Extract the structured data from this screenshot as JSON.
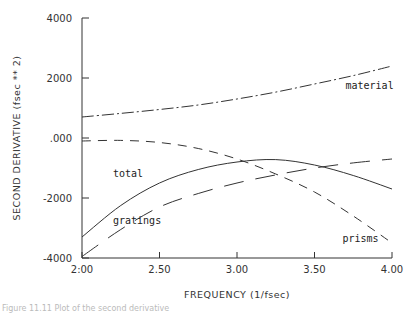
{
  "chart_data": {
    "type": "line",
    "title": "",
    "xlabel": "FREQUENCY (1/fsec)",
    "ylabel": "SECOND DERIVATIVE (fsec ** 2)",
    "xlim": [
      2.0,
      4.0
    ],
    "ylim": [
      -4000,
      4000
    ],
    "x_ticks": [
      2.0,
      2.5,
      3.0,
      3.5,
      4.0
    ],
    "x_tick_labels": [
      "2:00",
      "2.50",
      "3.00",
      "3.50",
      "4.00"
    ],
    "y_ticks": [
      4000,
      2000,
      0,
      -2000,
      -4000
    ],
    "y_tick_labels": [
      "4000",
      "2000",
      ".000",
      "-2000",
      "-4000"
    ],
    "grid": false,
    "legend": "inline labels",
    "x": [
      2.0,
      2.25,
      2.5,
      2.75,
      3.0,
      3.25,
      3.5,
      3.75,
      4.0
    ],
    "series": [
      {
        "name": "material",
        "style": "dash-dot",
        "values": [
          700,
          820,
          950,
          1100,
          1300,
          1530,
          1800,
          2080,
          2400
        ],
        "label_pos": [
          3.7,
          1650
        ]
      },
      {
        "name": "prisms",
        "style": "short-dash",
        "values": [
          -100,
          -80,
          -150,
          -350,
          -700,
          -1200,
          -1800,
          -2600,
          -3500
        ],
        "label_pos": [
          3.68,
          -3450
        ]
      },
      {
        "name": "total",
        "style": "solid",
        "values": [
          -3300,
          -2250,
          -1500,
          -1050,
          -800,
          -720,
          -900,
          -1250,
          -1700
        ],
        "label_pos": [
          2.2,
          -1300
        ]
      },
      {
        "name": "gratings",
        "style": "long-dash",
        "values": [
          -3950,
          -3050,
          -2300,
          -1850,
          -1500,
          -1230,
          -1000,
          -830,
          -700
        ],
        "label_pos": [
          2.2,
          -2850
        ]
      }
    ]
  },
  "caption": "Figure 11.11  Plot of the second derivative"
}
